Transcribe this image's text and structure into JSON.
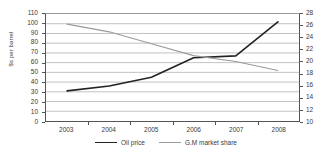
{
  "chart_data": {
    "type": "line",
    "title": "",
    "xlabel": "",
    "ylabel": "$s per barrel",
    "y2label": "",
    "grid": true,
    "legend_position": "bottom",
    "categories": [
      "2003",
      "2004",
      "2005",
      "2006",
      "2007",
      "2008"
    ],
    "ylim": [
      0,
      110
    ],
    "y2lim": [
      10,
      28
    ],
    "yticks": [
      0,
      10,
      20,
      30,
      40,
      50,
      60,
      70,
      80,
      90,
      100,
      110
    ],
    "y2ticks": [
      10,
      12,
      14,
      16,
      18,
      20,
      22,
      24,
      26,
      28
    ],
    "series": [
      {
        "name": "Oil price",
        "axis": "left",
        "color": "#222222",
        "values": [
          31,
          36,
          45,
          65,
          67,
          102
        ]
      },
      {
        "name": "G.M market share",
        "axis": "right",
        "color": "#9b9b9b",
        "values": [
          26.3,
          25.0,
          23.0,
          21.0,
          20.0,
          18.5
        ]
      }
    ]
  },
  "axes": {
    "y_label": "$s per barrel",
    "y_ticks": [
      "110",
      "100",
      "90",
      "80",
      "70",
      "60",
      "50",
      "40",
      "30",
      "20",
      "10",
      "0"
    ],
    "y2_ticks": [
      "28",
      "26",
      "24",
      "22",
      "20",
      "18",
      "16",
      "14",
      "12",
      "10"
    ],
    "x_ticks": [
      "2003",
      "2004",
      "2005",
      "2006",
      "2007",
      "2008"
    ]
  },
  "legend": {
    "items": [
      {
        "label": "Oil price",
        "color": "#222222"
      },
      {
        "label": "G.M market share",
        "color": "#9b9b9b"
      }
    ]
  }
}
